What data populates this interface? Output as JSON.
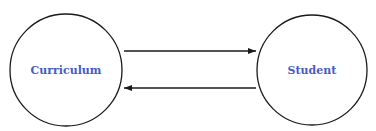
{
  "diagram": {
    "nodes": [
      {
        "id": "curriculum",
        "label": "Curriculum",
        "cx": 66,
        "cy": 70,
        "r": 56
      },
      {
        "id": "student",
        "label": "Student",
        "cx": 312,
        "cy": 70,
        "r": 55
      }
    ],
    "edges": [
      {
        "from": "curriculum",
        "to": "student",
        "x1": 124,
        "y1": 51,
        "x2": 256,
        "y2": 51
      },
      {
        "from": "student",
        "to": "curriculum",
        "x1": 256,
        "y1": 88,
        "x2": 124,
        "y2": 88
      }
    ],
    "colors": {
      "stroke": "#1a1a1a",
      "label": "#4a5bc4",
      "background": "#ffffff"
    }
  }
}
